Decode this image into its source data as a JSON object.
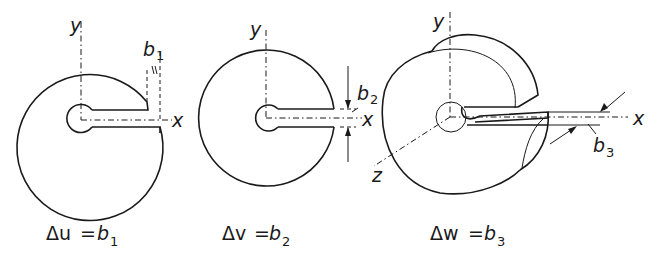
{
  "figures": [
    {
      "id": "edge-dislocation-u",
      "axes": {
        "x": "x",
        "y": "y"
      },
      "burgers_label": "b",
      "burgers_sub": "1",
      "caption": {
        "lhs": "Δu",
        "eq": "=",
        "rhs": "b",
        "rhs_sub": "1"
      }
    },
    {
      "id": "edge-dislocation-v",
      "axes": {
        "x": "x",
        "y": "y"
      },
      "burgers_label": "b",
      "burgers_sub": "2",
      "caption": {
        "lhs": "Δv",
        "eq": "=",
        "rhs": "b",
        "rhs_sub": "2"
      }
    },
    {
      "id": "screw-dislocation-w",
      "axes": {
        "x": "x",
        "y": "y",
        "z": "z"
      },
      "burgers_label": "b",
      "burgers_sub": "3",
      "caption": {
        "lhs": "Δw",
        "eq": "=",
        "rhs": "b",
        "rhs_sub": "3"
      }
    }
  ],
  "colors": {
    "ink": "#1a1a1a",
    "background": "#ffffff"
  }
}
